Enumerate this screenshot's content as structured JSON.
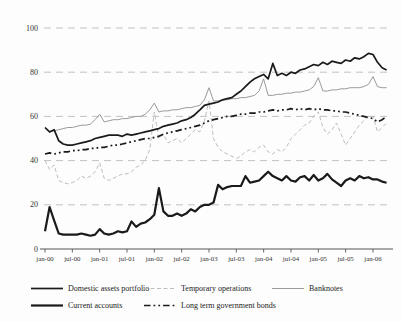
{
  "chart_data": {
    "type": "line",
    "title": "",
    "xlabel": "",
    "ylabel": "",
    "ylim": [
      0,
      100
    ],
    "y_ticks": [
      0,
      20,
      40,
      60,
      80,
      100
    ],
    "grid": "horizontal-dashed",
    "legend_position": "bottom",
    "x_unit": "month",
    "x_start": "jan-00",
    "x_tick_labels": [
      "jan-00",
      "jul-00",
      "jan-01",
      "jul-01",
      "jan-02",
      "jul-02",
      "jan-03",
      "jul-03",
      "jan-04",
      "jul-04",
      "jan-05",
      "jul-05",
      "jan-06"
    ],
    "colors": {
      "axis": "#555555",
      "grid": "#bbbbbb",
      "black_line": "#1a1a1a",
      "gray_line": "#8f8f8f",
      "light_dashed_line": "#b5b5b5"
    },
    "series": [
      {
        "name": "Domestic assets portfolio",
        "style": "solid",
        "color": "#1a1a1a",
        "width": 1.7,
        "values": [
          55,
          53,
          54,
          49,
          47.5,
          47,
          47,
          47.5,
          48,
          48.5,
          49,
          50,
          50.5,
          51,
          51.5,
          51.5,
          51.5,
          51,
          52,
          51.5,
          52,
          52.5,
          53,
          53.5,
          54,
          54.5,
          55.5,
          56,
          56.5,
          57,
          58,
          58.5,
          59.5,
          61,
          63,
          65,
          65.5,
          66,
          66.5,
          67.5,
          68,
          68.5,
          70,
          71.5,
          73.5,
          75.5,
          77,
          78,
          79,
          77,
          84,
          78.5,
          79.5,
          78.5,
          80,
          79.5,
          81,
          81.5,
          82.5,
          83.5,
          83,
          84.5,
          83.5,
          85,
          84.5,
          84,
          85.5,
          85,
          86.5,
          86,
          87,
          88.5,
          88,
          84.5,
          82,
          81
        ]
      },
      {
        "name": "Temporary operations",
        "style": "dashed",
        "color": "#b5b5b5",
        "width": 0.9,
        "values": [
          40,
          36,
          38,
          31,
          30,
          29.5,
          30,
          31,
          33,
          32,
          33,
          35,
          39,
          32,
          31,
          32,
          33,
          34,
          34,
          35,
          37,
          38,
          40,
          45,
          62,
          50,
          52,
          48,
          49,
          50,
          48,
          50,
          52,
          54,
          53,
          58,
          67,
          50,
          46,
          44,
          43,
          42,
          41,
          42,
          44,
          45,
          44,
          46,
          47,
          44,
          43,
          45,
          44,
          46,
          50,
          52,
          54,
          56,
          57,
          60,
          62,
          55,
          52,
          54,
          57,
          52,
          47,
          50,
          53,
          56,
          58,
          60,
          60,
          53,
          55,
          57
        ]
      },
      {
        "name": "Banknotes",
        "style": "solid",
        "color": "#8f8f8f",
        "width": 0.9,
        "values": [
          55,
          53,
          53.5,
          54,
          54.5,
          55,
          55,
          55.5,
          56,
          56,
          56.5,
          58.5,
          61,
          57.5,
          58,
          58.5,
          58.5,
          59,
          59,
          59.5,
          60,
          60,
          61,
          63,
          66,
          62,
          62.5,
          62.5,
          63,
          63,
          63.5,
          64,
          64,
          64.5,
          65,
          67.5,
          73,
          67,
          67,
          67.5,
          67.5,
          68,
          68,
          68.5,
          68.5,
          69,
          69.5,
          71.5,
          77,
          69.5,
          69.5,
          70,
          70,
          70.5,
          70.5,
          71,
          71,
          71.5,
          72,
          73.5,
          77.5,
          71.5,
          71.5,
          72,
          72,
          72.5,
          72.5,
          73,
          73,
          73,
          73.5,
          74.5,
          78,
          73.5,
          73,
          73
        ]
      },
      {
        "name": "Current accounts",
        "style": "solid",
        "color": "#1a1a1a",
        "width": 2.2,
        "values": [
          8,
          19,
          13,
          7,
          6.5,
          6.5,
          6.5,
          6.5,
          7,
          6.5,
          6,
          6.5,
          9,
          7,
          6.5,
          7,
          8,
          7.5,
          8,
          12.5,
          10,
          11.5,
          12,
          13.5,
          15.5,
          27.5,
          17,
          15,
          15,
          16,
          15,
          16,
          18,
          17,
          19,
          20,
          20,
          21,
          29,
          27,
          28,
          28.5,
          28.5,
          28.5,
          33,
          30,
          30.5,
          31,
          33,
          35,
          33,
          32,
          31,
          33,
          31,
          30.5,
          32.5,
          33,
          31,
          33.5,
          31,
          32,
          34,
          31.5,
          30,
          28.5,
          31,
          32,
          31,
          33,
          32,
          32.5,
          31.5,
          31.5,
          30.5,
          30
        ]
      },
      {
        "name": "Long term government bonds",
        "style": "dashdot",
        "color": "#1a1a1a",
        "width": 1.7,
        "values": [
          43,
          43.5,
          43,
          43.5,
          44,
          44,
          44.5,
          44.5,
          45,
          45,
          45.5,
          45.5,
          46,
          46,
          46.5,
          47,
          47,
          47.5,
          48,
          48.5,
          49,
          49.5,
          50,
          50,
          50.5,
          51,
          52,
          52.5,
          53,
          53.5,
          54,
          54.5,
          55,
          55.5,
          56,
          57,
          58,
          58.5,
          59,
          59.5,
          60,
          60,
          60.5,
          61,
          61,
          61.5,
          61.5,
          62,
          62,
          62.5,
          63,
          62.5,
          63,
          63,
          63.5,
          63,
          63.5,
          63,
          63.5,
          63,
          63.5,
          63,
          63,
          62.5,
          62.5,
          62,
          62,
          61.5,
          61,
          60.5,
          60,
          59.5,
          59,
          57.5,
          58.5,
          60
        ]
      }
    ],
    "legend_rows": [
      [
        0,
        1,
        2
      ],
      [
        3,
        4
      ]
    ]
  }
}
